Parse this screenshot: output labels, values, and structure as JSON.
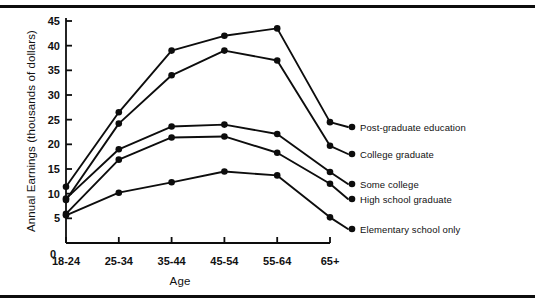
{
  "figure": {
    "background_color": "#ffffff",
    "ink_color": "#0d0d0d",
    "top_rule": "horizontal-rule",
    "bottom_rule": "horizontal-rule"
  },
  "chart_data": {
    "type": "line",
    "title": "",
    "xlabel": "Age",
    "ylabel": "Annual Earnings (thousands of dollars)",
    "categories": [
      "18-24",
      "25-34",
      "35-44",
      "45-54",
      "55-64",
      "65+"
    ],
    "ylim": [
      0,
      45
    ],
    "yticks": [
      0,
      5,
      10,
      15,
      20,
      25,
      30,
      35,
      40,
      45
    ],
    "ytick_labels": [
      "0",
      "5",
      "10",
      "15",
      "20",
      "25",
      "30",
      "35",
      "40",
      "45"
    ],
    "grid": false,
    "legend_position": "right-inline-labels",
    "marker": "filled-circle",
    "series": [
      {
        "name": "Post-graduate education",
        "values": [
          11.4,
          26.5,
          39.0,
          42.0,
          43.5,
          24.5
        ]
      },
      {
        "name": "College graduate",
        "values": [
          8.7,
          24.2,
          34.0,
          39.0,
          37.0,
          19.7
        ]
      },
      {
        "name": "Some college",
        "values": [
          9.0,
          19.0,
          23.6,
          24.0,
          22.1,
          14.4
        ]
      },
      {
        "name": "High school graduate",
        "values": [
          5.9,
          16.9,
          21.4,
          21.6,
          18.3,
          12.0
        ]
      },
      {
        "name": "Elementary school only",
        "values": [
          5.6,
          10.2,
          12.3,
          14.5,
          13.7,
          5.2
        ]
      }
    ]
  },
  "legend": {
    "entries": [
      {
        "label": "Post-graduate education",
        "series_index": 0
      },
      {
        "label": "College graduate",
        "series_index": 1
      },
      {
        "label": "Some college",
        "series_index": 2
      },
      {
        "label": "High school graduate",
        "series_index": 3
      },
      {
        "label": "Elementary school only",
        "series_index": 4
      }
    ]
  }
}
